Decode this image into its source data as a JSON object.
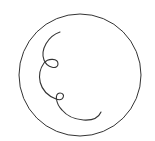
{
  "drawing": {
    "description": "Circle containing a curly loop line",
    "stroke_color": "#333333",
    "background_color": "#ffffff",
    "circle": {
      "cx": 80,
      "cy": 75,
      "r": 61
    },
    "curl_path": "M60,32 C48,36 40,50 44,60 C47,68 58,70 58,64 C58,58 48,58 44,63 C36,74 38,92 56,99 C64,102 66,93 60,93 C54,93 56,104 62,110 C72,122 96,124 101,112"
  }
}
